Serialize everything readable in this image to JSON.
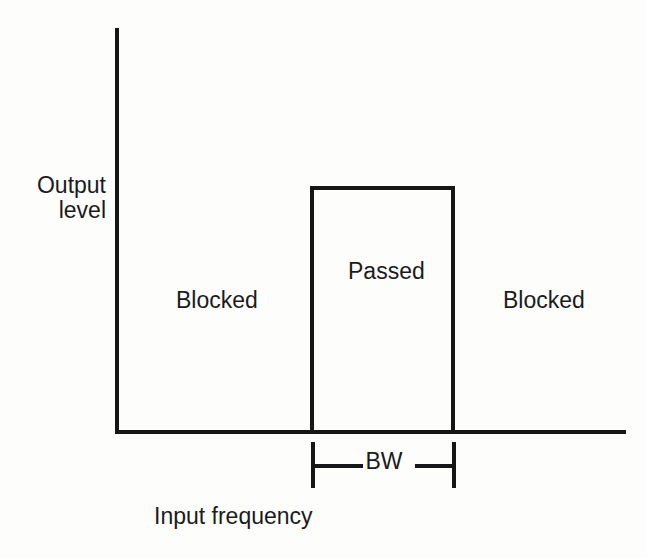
{
  "figure": {
    "background_color": "#fdfdfc",
    "ink_color": "#161616",
    "text_color": "#1b1b1b"
  },
  "axes": {
    "y_title_line1": "Output",
    "y_title_line2": "level",
    "x_title": "Input frequency"
  },
  "regions": {
    "blocked_left": "Blocked",
    "passed": "Passed",
    "blocked_right": "Blocked"
  },
  "bandwidth": {
    "label": "BW"
  },
  "chart_data": {
    "type": "line",
    "title": "",
    "subtitle": "",
    "xlabel": "Input frequency",
    "ylabel": "Output level",
    "grid": false,
    "legend": null,
    "axis_ticks": {
      "x": [],
      "y": []
    },
    "xlim": [
      0,
      100
    ],
    "ylim": [
      0,
      100
    ],
    "series": [
      {
        "name": "Ideal band-pass response",
        "x": [
          0,
          38,
          38,
          66,
          66,
          100
        ],
        "y": [
          0,
          0,
          100,
          100,
          0,
          0
        ]
      }
    ],
    "annotations": [
      {
        "text": "Blocked",
        "x": 21,
        "y": 33
      },
      {
        "text": "Passed",
        "x": 52,
        "y": 40
      },
      {
        "text": "Blocked",
        "x": 85,
        "y": 33
      },
      {
        "text": "BW",
        "x": 52,
        "y": -14
      }
    ],
    "dimension_lines": [
      {
        "label": "BW",
        "from_x": 38,
        "to_x": 66,
        "y": -14
      }
    ]
  }
}
